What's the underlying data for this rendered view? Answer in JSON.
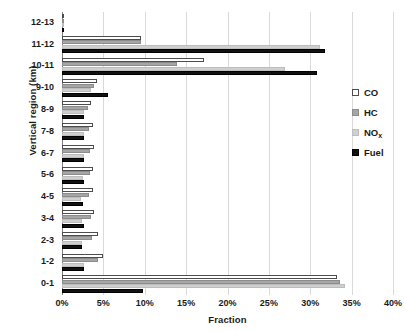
{
  "chart_data": {
    "type": "bar",
    "orientation": "horizontal",
    "title": "",
    "xlabel": "Fraction",
    "ylabel": "Vertical region (km)",
    "xlim": [
      0,
      40
    ],
    "xtick_labels": [
      "0%",
      "5%",
      "10%",
      "15%",
      "20%",
      "25%",
      "30%",
      "35%",
      "40%"
    ],
    "xtick_values": [
      0,
      5,
      10,
      15,
      20,
      25,
      30,
      35,
      40
    ],
    "grid": true,
    "legend_position": "right",
    "categories": [
      "0-1",
      "1-2",
      "2-3",
      "3-4",
      "4-5",
      "5-6",
      "6-7",
      "7-8",
      "8-9",
      "9-10",
      "10-11",
      "11-12",
      "12-13"
    ],
    "series": [
      {
        "name": "CO",
        "color": "#ffffff",
        "edge_color": "#4d4d4d",
        "values": [
          33.2,
          4.9,
          4.3,
          3.9,
          3.7,
          3.8,
          3.9,
          3.7,
          3.5,
          4.2,
          17.2,
          9.5,
          0.15
        ]
      },
      {
        "name": "HC",
        "color": "#a6a6a6",
        "edge_color": "#8c8c8c",
        "values": [
          33.6,
          4.4,
          3.6,
          3.5,
          3.3,
          3.4,
          3.4,
          3.3,
          3.2,
          3.9,
          13.9,
          9.6,
          0.15
        ]
      },
      {
        "name": "NOx",
        "color": "#cfcfcf",
        "edge_color": "#bdbdbd",
        "values": [
          34.2,
          2.7,
          2.4,
          2.4,
          2.3,
          2.5,
          2.6,
          2.6,
          2.7,
          3.5,
          27.0,
          31.2,
          0.1
        ]
      },
      {
        "name": "Fuel",
        "color": "#111111",
        "edge_color": "#000000",
        "values": [
          9.8,
          2.6,
          2.4,
          2.6,
          2.5,
          2.6,
          2.7,
          2.6,
          2.7,
          5.6,
          30.8,
          31.8,
          0.1
        ]
      }
    ]
  },
  "legend": {
    "entries": [
      {
        "label": "CO",
        "sub": "",
        "key": "co"
      },
      {
        "label": "HC",
        "sub": "",
        "key": "hc"
      },
      {
        "label": "NO",
        "sub": "x",
        "key": "nox"
      },
      {
        "label": "Fuel",
        "sub": "",
        "key": "fuel"
      }
    ]
  }
}
